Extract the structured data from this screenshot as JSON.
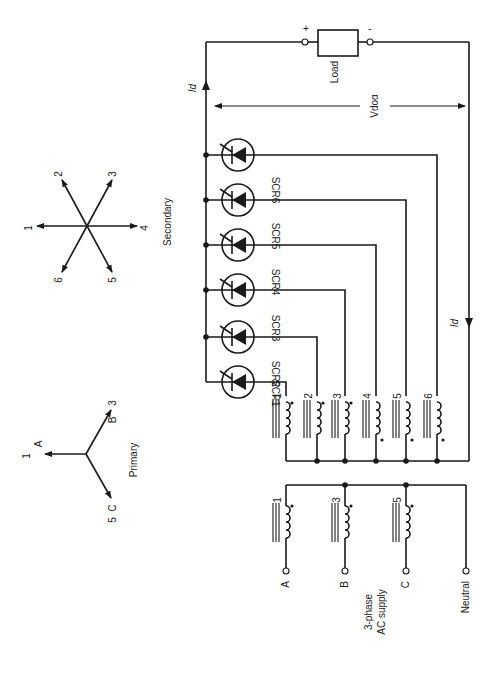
{
  "diagram": {
    "title_labels": {
      "primary": "Primary",
      "secondary": "Secondary",
      "supply": [
        "3-phase",
        "AC supply"
      ],
      "load": "Load",
      "load_plus": "+",
      "load_minus": "-",
      "current_top": "Id",
      "current_right": "Id",
      "voltage": "Vdoα"
    },
    "primary_phasor": {
      "vectors": [
        {
          "num": "1",
          "phase": "A"
        },
        {
          "num": "3",
          "phase": "B"
        },
        {
          "num": "5",
          "phase": "C"
        }
      ]
    },
    "secondary_phasor": {
      "vectors": [
        "1",
        "2",
        "3",
        "4",
        "5",
        "6"
      ]
    },
    "scrs": [
      "SCR1",
      "SCR2",
      "SCR3",
      "SCR4",
      "SCR5",
      "SCR6"
    ],
    "secondary_windings": [
      "1",
      "2",
      "3",
      "4",
      "5",
      "6"
    ],
    "primary_windings": [
      "1",
      "3",
      "5"
    ],
    "supply_terminals": [
      "A",
      "B",
      "C",
      "Neutral"
    ]
  }
}
